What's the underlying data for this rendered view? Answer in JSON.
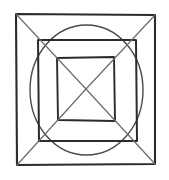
{
  "figure": {
    "background_color": "#ffffff",
    "ink_color": "#2b2b2b",
    "canvas": {
      "width": 169,
      "height": 180
    },
    "center": {
      "x": 86,
      "y": 89
    },
    "shapes": [
      {
        "name": "outer-square",
        "type": "quadrilateral",
        "stroke_color": "#2b2b2b",
        "stroke_width": 2.1,
        "points": "16,14 155,15 155,164 17,165"
      },
      {
        "name": "inscribed-circle",
        "type": "ellipse",
        "stroke_color": "#4a4a4a",
        "stroke_width": 1.4,
        "cx": 86.5,
        "cy": 90,
        "rx": 56.5,
        "ry": 65
      },
      {
        "name": "middle-square",
        "type": "quadrilateral",
        "stroke_color": "#2b2b2b",
        "stroke_width": 2.0,
        "points": "38,40 136,40 137,141 39,141"
      },
      {
        "name": "inner-square",
        "type": "quadrilateral",
        "stroke_color": "#2b2b2b",
        "stroke_width": 1.9,
        "points": "57,58 114,57 115,121 58,120"
      },
      {
        "name": "diagonal-top-left",
        "type": "line",
        "stroke_color": "#6b6b6b",
        "stroke_width": 1.2,
        "points": "16,14 86,89"
      },
      {
        "name": "diagonal-top-right",
        "type": "line",
        "stroke_color": "#6b6b6b",
        "stroke_width": 1.2,
        "points": "155,15 86,89"
      },
      {
        "name": "diagonal-bottom-right",
        "type": "line",
        "stroke_color": "#6b6b6b",
        "stroke_width": 1.2,
        "points": "155,164 86,89"
      },
      {
        "name": "diagonal-bottom-left",
        "type": "line",
        "stroke_color": "#6b6b6b",
        "stroke_width": 1.2,
        "points": "17,165 86,89"
      }
    ],
    "counts": {
      "squares": 3,
      "circles": 1,
      "diagonals": 4
    }
  }
}
